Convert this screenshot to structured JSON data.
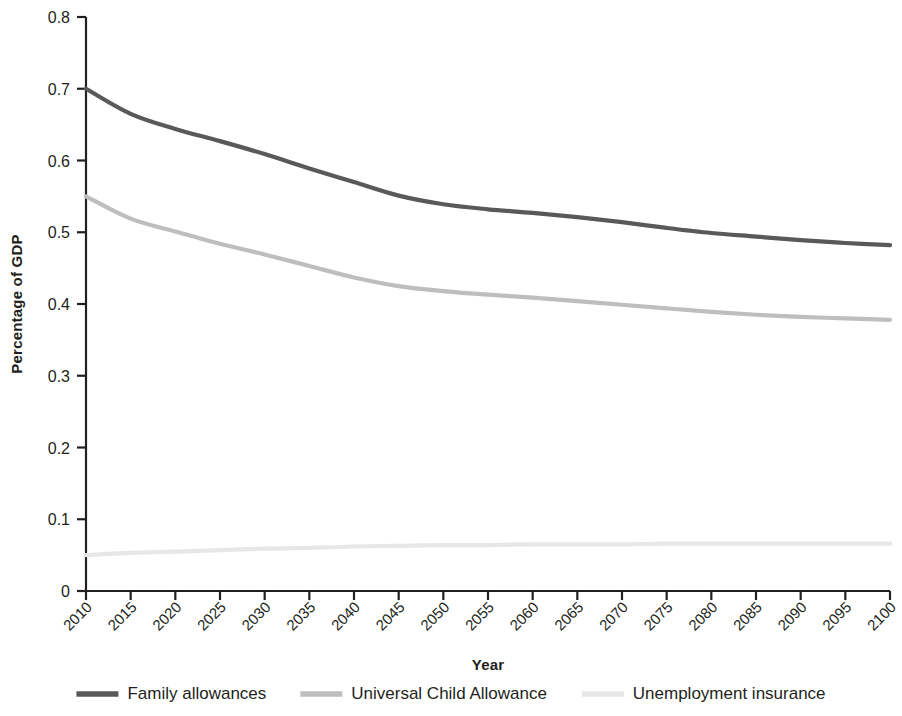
{
  "chart_data": {
    "type": "line",
    "title": "",
    "xlabel": "Year",
    "ylabel": "Percentage of GDP",
    "xlim": [
      2010,
      2100
    ],
    "ylim": [
      0,
      0.8
    ],
    "grid": false,
    "legend_position": "bottom",
    "x": [
      2010,
      2015,
      2020,
      2025,
      2030,
      2035,
      2040,
      2045,
      2050,
      2055,
      2060,
      2065,
      2070,
      2075,
      2080,
      2085,
      2090,
      2095,
      2100
    ],
    "xticklabels": [
      "2010",
      "2015",
      "2020",
      "2025",
      "2030",
      "2035",
      "2040",
      "2045",
      "2050",
      "2055",
      "2060",
      "2065",
      "2070",
      "2075",
      "2080",
      "2085",
      "2090",
      "2095",
      "2100"
    ],
    "yticklabels": [
      "0",
      "0.1",
      "0.2",
      "0.3",
      "0.4",
      "0.5",
      "0.6",
      "0.7",
      "0.8"
    ],
    "ytickvalues": [
      0,
      0.1,
      0.2,
      0.3,
      0.4,
      0.5,
      0.6,
      0.7,
      0.8
    ],
    "series": [
      {
        "name": "Family allowances",
        "color": "#58595b",
        "width": 4.2,
        "values": [
          0.7,
          0.665,
          0.644,
          0.627,
          0.609,
          0.589,
          0.57,
          0.551,
          0.539,
          0.532,
          0.527,
          0.521,
          0.514,
          0.506,
          0.499,
          0.494,
          0.489,
          0.485,
          0.482
        ]
      },
      {
        "name": "Universal Child Allowance",
        "color": "#bcbec0",
        "width": 4.2,
        "values": [
          0.55,
          0.519,
          0.501,
          0.484,
          0.469,
          0.453,
          0.437,
          0.425,
          0.418,
          0.413,
          0.409,
          0.404,
          0.399,
          0.394,
          0.389,
          0.385,
          0.382,
          0.38,
          0.378
        ]
      },
      {
        "name": "Unemployment insurance",
        "color": "#e6e7e8",
        "width": 4.2,
        "values": [
          0.05,
          0.053,
          0.055,
          0.057,
          0.059,
          0.06,
          0.062,
          0.063,
          0.064,
          0.064,
          0.065,
          0.065,
          0.065,
          0.066,
          0.066,
          0.066,
          0.066,
          0.066,
          0.066
        ]
      }
    ]
  },
  "legend": {
    "items": [
      {
        "label": "Family allowances",
        "color": "#58595b"
      },
      {
        "label": "Universal Child Allowance",
        "color": "#bcbec0"
      },
      {
        "label": "Unemployment insurance",
        "color": "#e6e7e8"
      }
    ]
  },
  "axes": {
    "x_title": "Year",
    "y_title": "Percentage of GDP"
  },
  "colors": {
    "axis": "#231f20",
    "background": "#ffffff",
    "series_dark": "#58595b",
    "series_medium": "#bcbec0",
    "series_light": "#e6e7e8"
  }
}
